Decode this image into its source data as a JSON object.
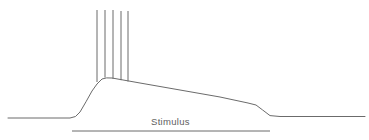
{
  "figure": {
    "background_color": "#ffffff",
    "line_color": "#6b6b6b",
    "width": 369,
    "height": 140
  },
  "labels": {
    "stimulus": "Stimulus"
  },
  "chart_data": {
    "type": "line",
    "xlabel": "",
    "ylabel": "",
    "grid": false,
    "legend": "none",
    "xlim": [
      0,
      369
    ],
    "ylim": [
      140,
      0
    ],
    "annotations": [
      {
        "text": "Stimulus",
        "x": 178,
        "y": 122
      }
    ],
    "series": [
      {
        "name": "membrane-potential-trace",
        "type": "line",
        "color": "#6b6b6b",
        "points": [
          [
            8,
            118
          ],
          [
            60,
            118
          ],
          [
            70,
            118
          ],
          [
            76,
            116
          ],
          [
            82,
            110
          ],
          [
            88,
            100
          ],
          [
            93,
            90
          ],
          [
            97,
            83
          ],
          [
            101,
            79
          ],
          [
            106,
            77.5
          ],
          [
            112,
            78
          ],
          [
            140,
            83
          ],
          [
            180,
            90
          ],
          [
            220,
            97
          ],
          [
            248,
            103
          ],
          [
            256,
            105
          ],
          [
            262,
            109
          ],
          [
            268,
            114
          ],
          [
            272,
            116
          ],
          [
            280,
            116.5
          ],
          [
            320,
            116.5
          ],
          [
            365,
            116.5
          ]
        ]
      },
      {
        "name": "action-potential-spikes",
        "type": "vertical-lines",
        "color": "#6b6b6b",
        "spike_top_y": 10,
        "spikes": [
          {
            "x": 97,
            "top": 10,
            "bottom": 82
          },
          {
            "x": 105,
            "top": 10,
            "bottom": 77.5
          },
          {
            "x": 113,
            "top": 10,
            "bottom": 78.8
          },
          {
            "x": 121,
            "top": 11,
            "bottom": 80.2
          },
          {
            "x": 128,
            "top": 11,
            "bottom": 81.5
          }
        ]
      },
      {
        "name": "stimulus-bar",
        "type": "segment",
        "color": "#6b6b6b",
        "x_start": 72,
        "x_end": 270,
        "y": 131
      }
    ]
  }
}
